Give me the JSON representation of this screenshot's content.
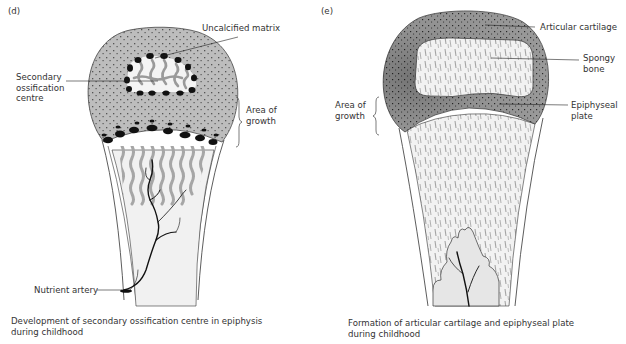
{
  "panels": [
    {
      "id": "d",
      "tag": "(d)",
      "labels": {
        "uncalcified_matrix": "Uncalcified matrix",
        "secondary_ossification_centre": "Secondary\nossification\ncentre",
        "area_of_growth": "Area of\ngrowth",
        "nutrient_artery": "Nutrient artery"
      },
      "caption": "Development of secondary ossification centre in epiphysis\nduring childhood"
    },
    {
      "id": "e",
      "tag": "(e)",
      "labels": {
        "articular_cartilage": "Articular cartilage",
        "spongy_bone": "Spongy\nbone",
        "area_of_growth": "Area of\ngrowth",
        "epiphyseal_plate": "Epiphyseal\nplate"
      },
      "caption": "Formation of articular cartilage and epiphyseal plate\nduring childhood"
    }
  ],
  "colors": {
    "cartilage_grey": "#b8b8b8",
    "cartilage_dark": "#8e8e8e",
    "bone_light": "#f0f0f0",
    "trabecular_grey": "#a8a8a8",
    "outline": "#333333"
  }
}
